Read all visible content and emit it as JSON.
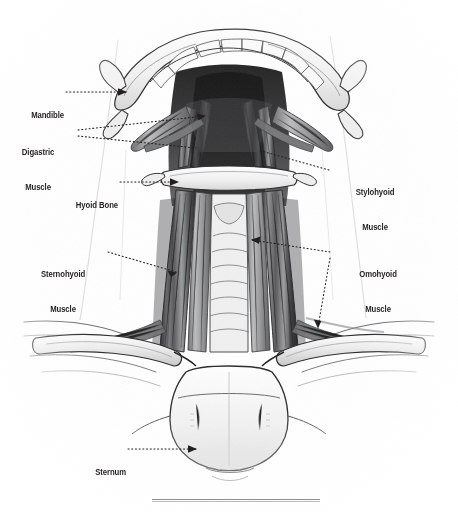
{
  "figure": {
    "style": "graphite pencil anatomical illustration",
    "background_color": "#ffffff",
    "ink_color": "#231f20",
    "leader_style": "dotted",
    "view": "inferior view of mandible and anterior neck"
  },
  "labels": [
    {
      "id": "mandible",
      "text": "Mandible",
      "lines": [
        "Mandible"
      ],
      "side": "left",
      "x": 22,
      "y": 87,
      "leader": {
        "from_x": 66,
        "from_y": 92,
        "to_x": 126,
        "to_y": 92,
        "arrow": true
      }
    },
    {
      "id": "digastric-muscle",
      "text": "Digastric Muscle",
      "lines": [
        "Digastric",
        "Muscle"
      ],
      "side": "left",
      "x": 27,
      "y": 124,
      "leader": {
        "from_x": 78,
        "from_y": 130,
        "to_x": 205,
        "to_y": 116,
        "arrow": true
      },
      "leader2": {
        "from_x": 78,
        "from_y": 136,
        "to_x": 196,
        "to_y": 148,
        "arrow": false
      }
    },
    {
      "id": "hyoid-bone",
      "text": "Hyoid Bone",
      "lines": [
        "Hyoid Bone"
      ],
      "side": "left",
      "x": 62,
      "y": 177,
      "leader": {
        "from_x": 120,
        "from_y": 182,
        "to_x": 178,
        "to_y": 182,
        "arrow": true
      }
    },
    {
      "id": "sternohyoid-muscle",
      "text": "Sternohyoid Muscle",
      "lines": [
        "Sternohyoid",
        "Muscle"
      ],
      "side": "left",
      "x": 46,
      "y": 246,
      "leader": {
        "from_x": 108,
        "from_y": 252,
        "to_x": 176,
        "to_y": 272,
        "arrow": true
      }
    },
    {
      "id": "sternum",
      "text": "Sternum",
      "lines": [
        "Sternum"
      ],
      "side": "left",
      "x": 84,
      "y": 444,
      "leader": {
        "from_x": 128,
        "from_y": 449,
        "to_x": 196,
        "to_y": 449,
        "arrow": true
      }
    },
    {
      "id": "stylohyoid-muscle",
      "text": "Stylohyoid Muscle",
      "lines": [
        "Stylohyoid",
        "Muscle"
      ],
      "side": "right",
      "x": 333,
      "y": 164,
      "leader": {
        "from_x": 329,
        "from_y": 170,
        "to_x": 258,
        "to_y": 150,
        "arrow": false
      }
    },
    {
      "id": "omohyoid-muscle",
      "text": "Omohyoid Muscle",
      "lines": [
        "Omohyoid",
        "Muscle"
      ],
      "side": "right",
      "x": 336,
      "y": 246,
      "leader": {
        "from_x": 330,
        "from_y": 252,
        "to_x": 252,
        "to_y": 240,
        "arrow": true
      },
      "leader2": {
        "from_x": 330,
        "from_y": 258,
        "to_x": 318,
        "to_y": 327,
        "arrow": true
      }
    }
  ],
  "footer": {
    "rule_color": "#8d8f92",
    "rule_present": true
  }
}
